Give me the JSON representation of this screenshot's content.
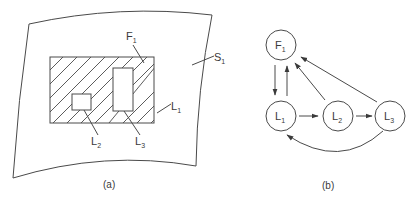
{
  "figure": {
    "panel_a": {
      "caption": "(a)",
      "labels": {
        "F1": {
          "main": "F",
          "sub": "1"
        },
        "S1": {
          "main": "S",
          "sub": "1"
        },
        "L1": {
          "main": "L",
          "sub": "1"
        },
        "L2": {
          "main": "L",
          "sub": "2"
        },
        "L3": {
          "main": "L",
          "sub": "3"
        }
      }
    },
    "panel_b": {
      "caption": "(b)",
      "nodes": [
        {
          "id": "F1",
          "main": "F",
          "sub": "1"
        },
        {
          "id": "L1",
          "main": "L",
          "sub": "1"
        },
        {
          "id": "L2",
          "main": "L",
          "sub": "2"
        },
        {
          "id": "L3",
          "main": "L",
          "sub": "3"
        }
      ],
      "edges": [
        {
          "from": "F1",
          "to": "L1"
        },
        {
          "from": "L1",
          "to": "F1"
        },
        {
          "from": "L2",
          "to": "F1"
        },
        {
          "from": "L3",
          "to": "F1"
        },
        {
          "from": "L1",
          "to": "L2"
        },
        {
          "from": "L2",
          "to": "L3"
        },
        {
          "from": "L3",
          "to": "L1",
          "curved": true
        }
      ]
    },
    "colors": {
      "line": "#4a4a4a",
      "text": "#3a3a3a",
      "background": "#ffffff"
    }
  }
}
